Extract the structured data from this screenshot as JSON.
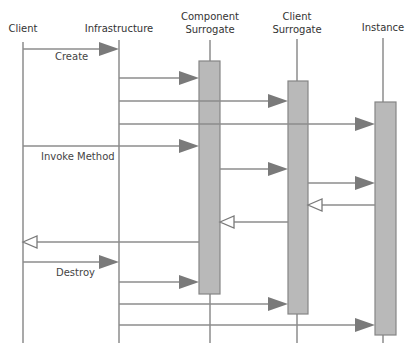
{
  "diagram": {
    "type": "sequence-diagram",
    "colors": {
      "line": "#8c8c8c",
      "arrow_fill": "#7a7a7a",
      "activation_fill": "#b9b9b9",
      "activation_stroke": "#858585",
      "text": "#333333",
      "background": "#ffffff"
    },
    "participants": [
      {
        "id": "client",
        "label_lines": [
          "Client"
        ],
        "x": 23,
        "label_y": [
          32
        ],
        "line_top": 42,
        "line_bottom": 343
      },
      {
        "id": "infrastructure",
        "label_lines": [
          "Infrastructure"
        ],
        "x": 119,
        "label_y": [
          32
        ],
        "line_top": 40,
        "line_bottom": 343
      },
      {
        "id": "component-surrogate",
        "label_lines": [
          "Component",
          "Surrogate"
        ],
        "x": 210,
        "label_y": [
          20,
          33
        ],
        "line_top": 40,
        "line_bottom": 343
      },
      {
        "id": "client-surrogate",
        "label_lines": [
          "Client",
          "Surrogate"
        ],
        "x": 297,
        "label_y": [
          20,
          33
        ],
        "line_top": 39,
        "line_bottom": 343
      },
      {
        "id": "instance",
        "label_lines": [
          "Instance"
        ],
        "x": 383,
        "label_y": [
          31
        ],
        "line_top": 38,
        "line_bottom": 343
      }
    ],
    "activations": [
      {
        "participant": "component-surrogate",
        "x": 199,
        "width": 21,
        "top": 61,
        "bottom": 294
      },
      {
        "participant": "client-surrogate",
        "x": 288,
        "width": 20,
        "top": 81,
        "bottom": 314
      },
      {
        "participant": "instance",
        "x": 375,
        "width": 21,
        "top": 102,
        "bottom": 335
      }
    ],
    "messages": [
      {
        "from": "client",
        "to": "infrastructure",
        "y": 49,
        "x1": 23,
        "x2": 119,
        "kind": "call",
        "label": "Create",
        "label_x": 55,
        "label_y": 60
      },
      {
        "from": "infrastructure",
        "to": "component-surrogate",
        "y": 78,
        "x1": 119,
        "x2": 199,
        "kind": "call"
      },
      {
        "from": "infrastructure",
        "to": "client-surrogate",
        "y": 101,
        "x1": 119,
        "x2": 288,
        "kind": "call"
      },
      {
        "from": "infrastructure",
        "to": "instance",
        "y": 124,
        "x1": 119,
        "x2": 375,
        "kind": "call"
      },
      {
        "from": "client",
        "to": "component-surrogate",
        "y": 146,
        "x1": 23,
        "x2": 199,
        "kind": "call",
        "label": "Invoke Method",
        "label_x": 41,
        "label_y": 160
      },
      {
        "from": "component-surrogate",
        "to": "client-surrogate",
        "y": 169,
        "x1": 220,
        "x2": 288,
        "kind": "call"
      },
      {
        "from": "client-surrogate",
        "to": "instance",
        "y": 183,
        "x1": 308,
        "x2": 375,
        "kind": "call"
      },
      {
        "from": "instance",
        "to": "client-surrogate",
        "y": 205,
        "x1": 375,
        "x2": 308,
        "kind": "return"
      },
      {
        "from": "client-surrogate",
        "to": "component-surrogate",
        "y": 222,
        "x1": 288,
        "x2": 220,
        "kind": "return"
      },
      {
        "from": "component-surrogate",
        "to": "client",
        "y": 242,
        "x1": 199,
        "x2": 23,
        "kind": "return"
      },
      {
        "from": "client",
        "to": "infrastructure",
        "y": 262,
        "x1": 23,
        "x2": 119,
        "kind": "call",
        "label": "Destroy",
        "label_x": 56,
        "label_y": 276
      },
      {
        "from": "infrastructure",
        "to": "component-surrogate",
        "y": 282,
        "x1": 119,
        "x2": 199,
        "kind": "call"
      },
      {
        "from": "infrastructure",
        "to": "client-surrogate",
        "y": 304,
        "x1": 119,
        "x2": 288,
        "kind": "call"
      },
      {
        "from": "infrastructure",
        "to": "instance",
        "y": 325,
        "x1": 119,
        "x2": 375,
        "kind": "call"
      }
    ]
  }
}
